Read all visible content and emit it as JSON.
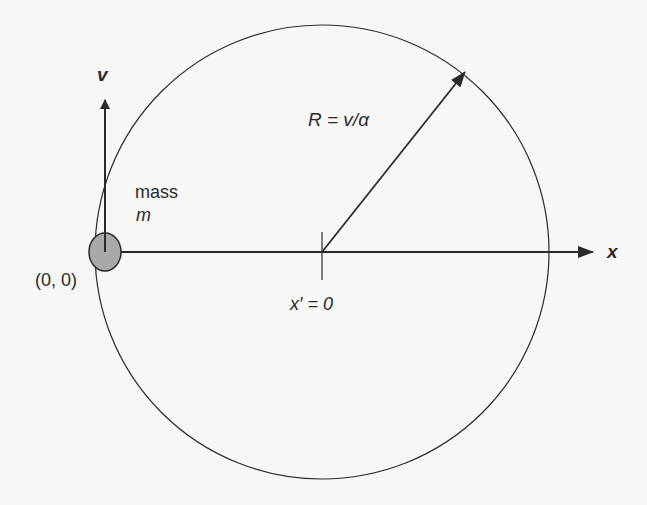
{
  "diagram": {
    "labels": {
      "velocity": "v",
      "radius": "R = v/α",
      "mass_word": "mass",
      "mass_symbol": "m",
      "origin": "(0, 0)",
      "center": "x′ = 0",
      "x_axis": "x"
    },
    "colors": {
      "line": "#2a2a2a",
      "mass_fill": "#a9a9a9",
      "background": "#f7f7f5"
    },
    "geometry": {
      "circle": {
        "cx": 322,
        "cy": 252,
        "r": 227
      },
      "mass": {
        "cx": 105,
        "cy": 252,
        "rx": 16,
        "ry": 19
      },
      "x_axis": {
        "x1": 107,
        "x2": 593,
        "y": 252
      },
      "velocity_arrow": {
        "x": 105,
        "y1": 252,
        "y2": 100
      },
      "radius_arrow": {
        "x1": 322,
        "y1": 252,
        "x2": 465,
        "y2": 72
      },
      "center_tick": {
        "x": 322,
        "y1": 232,
        "y2": 280
      }
    }
  }
}
